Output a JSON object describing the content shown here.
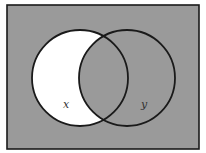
{
  "diagram": {
    "type": "venn",
    "sets": [
      {
        "id": "x",
        "label": "x",
        "cx": 80,
        "cy": 78,
        "r": 48
      },
      {
        "id": "y",
        "label": "y",
        "cx": 127,
        "cy": 78,
        "r": 48
      }
    ],
    "highlighted_region": "x only",
    "universe": {
      "x": 7,
      "y": 5,
      "width": 192,
      "height": 144
    },
    "colors": {
      "background": "#ffffff",
      "shaded": "#9a9a9a",
      "highlight": "#ffffff",
      "stroke": "#1a1a1a",
      "label": "#333333"
    }
  }
}
